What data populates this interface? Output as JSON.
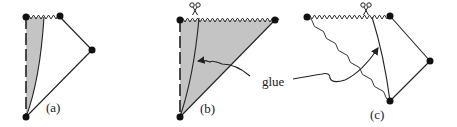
{
  "figure": {
    "panels": [
      {
        "id": "a",
        "label": "(a)"
      },
      {
        "id": "b",
        "label": "(b)"
      },
      {
        "id": "c",
        "label": "(c)"
      }
    ],
    "annotation": "glue",
    "icons": [
      "scissors-icon",
      "scissors-icon"
    ],
    "colors": {
      "ink": "#222222",
      "shade": "#c4c4c4"
    }
  }
}
